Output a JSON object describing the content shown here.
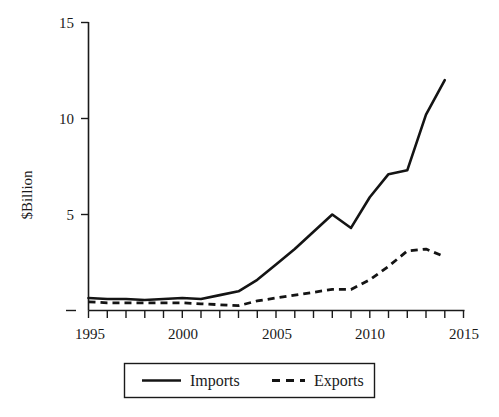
{
  "chart_data": {
    "type": "line",
    "title": "",
    "subtitle": "",
    "xlabel": "",
    "ylabel": "$Billion",
    "xlim": [
      1995,
      2015
    ],
    "ylim": [
      0,
      15
    ],
    "grid": false,
    "legend_position": "bottom-center",
    "x": [
      1995,
      1996,
      1997,
      1998,
      1999,
      2000,
      2001,
      2002,
      2003,
      2004,
      2005,
      2006,
      2007,
      2008,
      2009,
      2010,
      2011,
      2012,
      2013,
      2014
    ],
    "xticks": [
      1995,
      2000,
      2005,
      2010,
      2015
    ],
    "xtick_labels": [
      "1995",
      "2000",
      "2005",
      "2010",
      "2015"
    ],
    "xtick_minor_step": 1,
    "yticks": [
      0,
      5,
      10,
      15
    ],
    "ytick_labels": [
      "0",
      "5",
      "10",
      "15"
    ],
    "ytick_labels_shown": [
      "5",
      "10",
      "15"
    ],
    "series": [
      {
        "name": "Imports",
        "style": "solid",
        "values": [
          0.65,
          0.6,
          0.6,
          0.55,
          0.6,
          0.65,
          0.6,
          0.8,
          1.0,
          1.6,
          2.4,
          3.2,
          4.1,
          5.0,
          4.3,
          5.9,
          7.1,
          7.3,
          10.2,
          12.0
        ]
      },
      {
        "name": "Exports",
        "style": "dashed",
        "values": [
          0.45,
          0.4,
          0.4,
          0.4,
          0.4,
          0.4,
          0.35,
          0.3,
          0.25,
          0.5,
          0.65,
          0.8,
          0.95,
          1.1,
          1.1,
          1.6,
          2.3,
          3.1,
          3.2,
          2.8
        ]
      }
    ]
  },
  "legend": {
    "items": [
      {
        "label": "Imports",
        "style": "solid"
      },
      {
        "label": "Exports",
        "style": "dashed"
      }
    ]
  },
  "axes": {
    "y_title": "$Billion"
  }
}
